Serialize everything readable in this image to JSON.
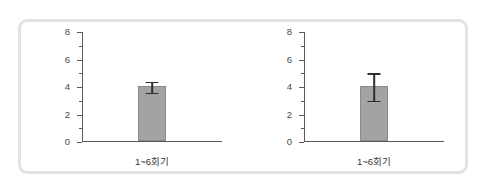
{
  "chart_data": [
    {
      "type": "bar",
      "title": "",
      "xlabel": "",
      "ylabel": "",
      "categories": [
        "1~6회기"
      ],
      "values": [
        4.0
      ],
      "errors": [
        0.4
      ],
      "error_low": [
        3.6
      ],
      "error_high": [
        4.4
      ],
      "ylim": [
        0,
        8
      ],
      "yticks": [
        0,
        2,
        4,
        6,
        8
      ],
      "ytick_labels": [
        "0",
        "2",
        "4",
        "6",
        "8"
      ],
      "yminor_ticks": [
        1,
        3,
        5,
        7
      ],
      "grid": false,
      "legend": "none",
      "bar_color": "#a3a3a3",
      "bar_edge_color": "#8a8a8a",
      "error_color": "#2e2e2e",
      "axis_color": "#5a5a5a"
    },
    {
      "type": "bar",
      "title": "",
      "xlabel": "",
      "ylabel": "",
      "categories": [
        "1~6회기"
      ],
      "values": [
        4.0
      ],
      "errors": [
        1.0
      ],
      "error_low": [
        3.0
      ],
      "error_high": [
        5.0
      ],
      "ylim": [
        0,
        8
      ],
      "yticks": [
        0,
        2,
        4,
        6,
        8
      ],
      "ytick_labels": [
        "0",
        "2",
        "4",
        "6",
        "8"
      ],
      "yminor_ticks": [
        1,
        3,
        5,
        7
      ],
      "grid": false,
      "legend": "none",
      "bar_color": "#a3a3a3",
      "bar_edge_color": "#8a8a8a",
      "error_color": "#2e2e2e",
      "axis_color": "#5a5a5a"
    }
  ],
  "panel": {
    "border_color": "#e2e2e2",
    "background": "#ffffff"
  }
}
